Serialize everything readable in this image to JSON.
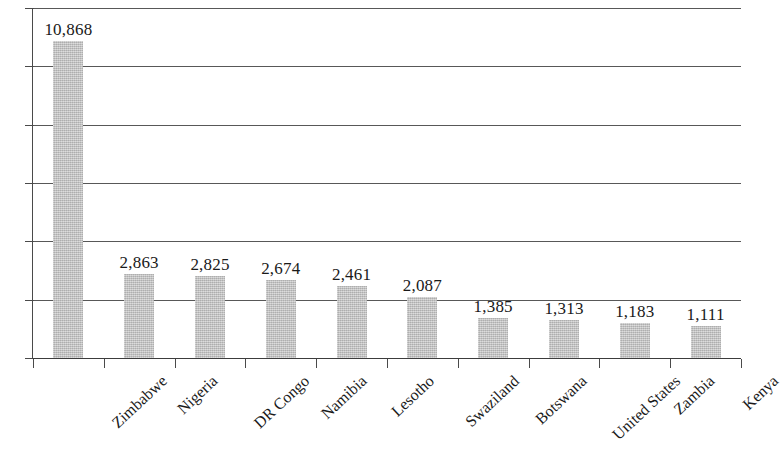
{
  "chart_data": {
    "type": "bar",
    "title": "",
    "subtitle": "",
    "xlabel": "",
    "ylabel": "",
    "categories": [
      "Zimbabwe",
      "Nigeria",
      "DR Congo",
      "Namibia",
      "Lesotho",
      "Swaziland",
      "Botswana",
      "United States",
      "Zambia",
      "Kenya"
    ],
    "values": [
      10868,
      2863,
      2825,
      2674,
      2461,
      2087,
      1385,
      1313,
      1183,
      1111
    ],
    "value_labels": [
      "10,868",
      "2,863",
      "2,825",
      "2,674",
      "2,461",
      "2,087",
      "1,385",
      "1,313",
      "1,183",
      "1,111"
    ],
    "ylim": [
      0,
      12000
    ],
    "y_tick_labels": [],
    "y_gridline_count": 6,
    "grid": true,
    "legend": false,
    "legend_position": "none",
    "bar_color": "#bfbfbf",
    "axis_color": "#4a4a4a",
    "gridline_color": "#585858",
    "label_text_color": "#1a1a1a"
  }
}
